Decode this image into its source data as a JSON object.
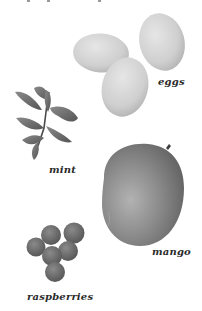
{
  "illustration": {
    "style": "grayscale",
    "items": [
      {
        "id": "eggs",
        "label": "eggs",
        "icon": "eggs-icon",
        "count": 3
      },
      {
        "id": "mint",
        "label": "mint",
        "icon": "mint-sprig-icon"
      },
      {
        "id": "mango",
        "label": "mango",
        "icon": "mango-icon",
        "count": 1
      },
      {
        "id": "raspberries",
        "label": "raspberries",
        "icon": "raspberries-icon",
        "count": 6
      }
    ]
  },
  "colors": {
    "background": "#ffffff",
    "label_text": "#2a2a2a",
    "egg": "#d4d4d4",
    "mint": "#6e6e6e",
    "mango": "#8a8a8a",
    "raspberry": "#6a6a6a"
  }
}
